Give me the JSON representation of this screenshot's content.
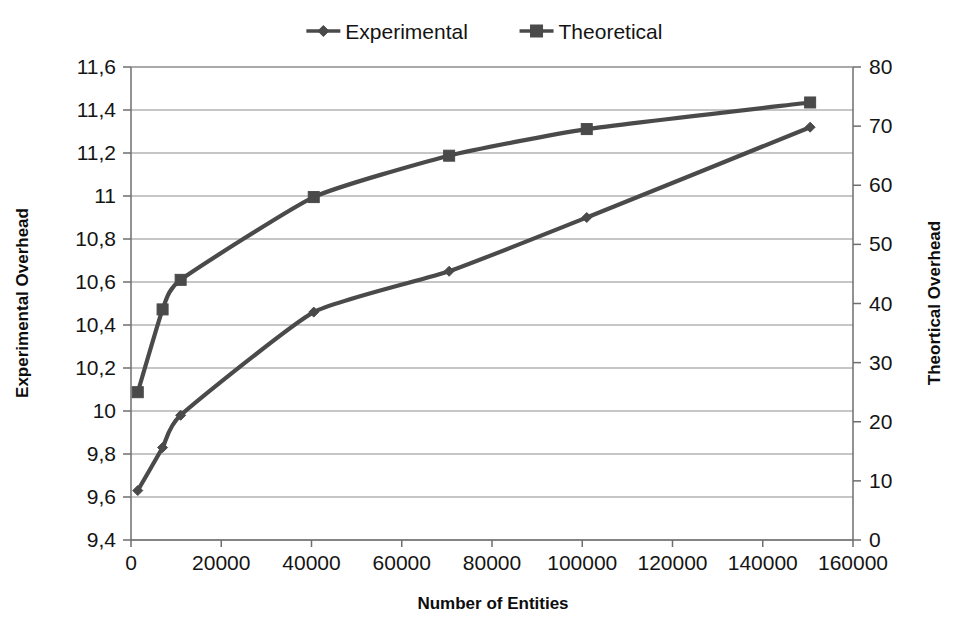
{
  "chart_data": {
    "type": "line",
    "title": "",
    "xlabel": "Number of Entities",
    "ylabel": "Experimental Overhead",
    "y2label": "Theortical Overhead",
    "xlim": [
      0,
      160000
    ],
    "ylim": [
      9.4,
      11.6
    ],
    "y2lim": [
      0,
      80
    ],
    "grid": true,
    "legend_position": "top-center",
    "decimal_separator": ",",
    "x_ticks": [
      "0",
      "20000",
      "40000",
      "60000",
      "80000",
      "100000",
      "120000",
      "140000",
      "160000"
    ],
    "x_tick_values": [
      0,
      20000,
      40000,
      60000,
      80000,
      100000,
      120000,
      140000,
      160000
    ],
    "y_ticks": [
      "9,4",
      "9,6",
      "9,8",
      "10",
      "10,2",
      "10,4",
      "10,6",
      "10,8",
      "11",
      "11,2",
      "11,4",
      "11,6"
    ],
    "y_tick_values": [
      9.4,
      9.6,
      9.8,
      10.0,
      10.2,
      10.4,
      10.6,
      10.8,
      11.0,
      11.2,
      11.4,
      11.6
    ],
    "y2_ticks": [
      "0",
      "10",
      "20",
      "30",
      "40",
      "50",
      "60",
      "70",
      "80"
    ],
    "y2_tick_values": [
      0,
      10,
      20,
      30,
      40,
      50,
      60,
      70,
      80
    ],
    "x": [
      1500,
      7000,
      11000,
      40500,
      70500,
      101000,
      150500
    ],
    "series": [
      {
        "name": "Experimental",
        "axis": "left",
        "marker": "diamond",
        "color": "#4a4a4a",
        "values": [
          9.63,
          9.83,
          9.98,
          10.46,
          10.65,
          10.9,
          11.32
        ]
      },
      {
        "name": "Theoretical",
        "axis": "right",
        "marker": "square",
        "color": "#4a4a4a",
        "values": [
          25,
          39,
          44,
          58,
          65,
          69.5,
          74
        ]
      }
    ]
  },
  "legend": {
    "items": [
      {
        "label": "Experimental",
        "marker": "diamond"
      },
      {
        "label": "Theoretical",
        "marker": "square"
      }
    ]
  },
  "colors": {
    "series": "#4a4a4a",
    "grid": "#8d8d8d",
    "axis": "#6e6e6e",
    "text": "#141414",
    "background": "#ffffff"
  }
}
